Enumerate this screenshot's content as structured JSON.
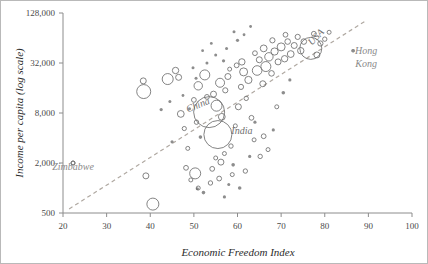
{
  "chart_data": {
    "type": "scatter",
    "title": "",
    "xlabel": "Economic Freedom Index",
    "ylabel": "Income per capita (log scale)",
    "xlim": [
      20,
      100
    ],
    "ylim": [
      500,
      128000
    ],
    "yscale": "log",
    "xticks": [
      20,
      30,
      40,
      50,
      60,
      70,
      80,
      90,
      100
    ],
    "xtick_labels": [
      "20",
      "30",
      "40",
      "50",
      "60",
      "70",
      "80",
      "90",
      "100"
    ],
    "yticks": [
      500,
      2000,
      8000,
      32000,
      128000
    ],
    "ytick_labels": [
      "500",
      "2,000",
      "8,000",
      "32,000",
      "128,000"
    ],
    "grid": false,
    "legend": "none",
    "marker_style": "open-circle-bubble",
    "size_encodes": "population",
    "trend_line": {
      "style": "dashed",
      "color": "#b0a9a2",
      "x_start": 21.4,
      "y_start": 560,
      "x_end": 89.5,
      "y_end": 104000
    },
    "annotations": [
      {
        "label": "Zimbabwe",
        "x": 22.3,
        "y": 1650,
        "marker_x": 22.3,
        "marker_y": 2000,
        "rotation": 0
      },
      {
        "label": "China",
        "x": 51.2,
        "y": 9200,
        "marker_x": 53.5,
        "marker_y": 8200,
        "rotation": -22
      },
      {
        "label": "India",
        "x": 61.0,
        "y": 4450,
        "marker_x": 55.5,
        "marker_y": 4400,
        "rotation": 0
      },
      {
        "label": "USA",
        "x": 78.5,
        "y": 62000,
        "marker_x": 76.8,
        "marker_y": 48000,
        "rotation": -45
      },
      {
        "label": "Hong Kong",
        "x": 89.5,
        "y": 41000,
        "marker_x": 86.5,
        "marker_y": 45000,
        "rotation": 0
      }
    ],
    "points": [
      {
        "x": 22.3,
        "y": 2000,
        "r": 2.0
      },
      {
        "x": 39.0,
        "y": 1400,
        "r": 3.0
      },
      {
        "x": 40.6,
        "y": 640,
        "r": 6.0
      },
      {
        "x": 38.5,
        "y": 14500,
        "r": 7.0
      },
      {
        "x": 38.4,
        "y": 19500,
        "r": 3.0
      },
      {
        "x": 44.0,
        "y": 20500,
        "r": 5.5
      },
      {
        "x": 42.5,
        "y": 8800,
        "r": 1.6
      },
      {
        "x": 45.0,
        "y": 3600,
        "r": 1.6
      },
      {
        "x": 45.8,
        "y": 26000,
        "r": 3.2
      },
      {
        "x": 46.5,
        "y": 21500,
        "r": 3.0
      },
      {
        "x": 47.0,
        "y": 7800,
        "r": 3.4
      },
      {
        "x": 47.8,
        "y": 5200,
        "r": 2.1
      },
      {
        "x": 48.6,
        "y": 3000,
        "r": 2.0
      },
      {
        "x": 48.2,
        "y": 1750,
        "r": 2.4
      },
      {
        "x": 49.3,
        "y": 1250,
        "r": 2.0
      },
      {
        "x": 50.3,
        "y": 1500,
        "r": 5.5
      },
      {
        "x": 50.8,
        "y": 980,
        "r": 1.6
      },
      {
        "x": 51.5,
        "y": 4100,
        "r": 1.8
      },
      {
        "x": 50.6,
        "y": 6200,
        "r": 2.2
      },
      {
        "x": 50.0,
        "y": 11500,
        "r": 2.4
      },
      {
        "x": 49.0,
        "y": 9000,
        "r": 1.5
      },
      {
        "x": 51.0,
        "y": 17000,
        "r": 4.2
      },
      {
        "x": 52.5,
        "y": 23000,
        "r": 5.0
      },
      {
        "x": 53.5,
        "y": 8200,
        "r": 15.5
      },
      {
        "x": 53.0,
        "y": 12500,
        "r": 2.4
      },
      {
        "x": 54.5,
        "y": 13500,
        "r": 3.0
      },
      {
        "x": 55.5,
        "y": 4400,
        "r": 14.0
      },
      {
        "x": 55.2,
        "y": 9800,
        "r": 5.5
      },
      {
        "x": 56.4,
        "y": 7200,
        "r": 3.4
      },
      {
        "x": 56.0,
        "y": 18500,
        "r": 4.5
      },
      {
        "x": 57.2,
        "y": 15000,
        "r": 2.6
      },
      {
        "x": 57.8,
        "y": 22000,
        "r": 3.0
      },
      {
        "x": 57.0,
        "y": 2600,
        "r": 2.0
      },
      {
        "x": 56.2,
        "y": 2050,
        "r": 3.0
      },
      {
        "x": 55.0,
        "y": 2300,
        "r": 2.0
      },
      {
        "x": 54.2,
        "y": 1700,
        "r": 2.4
      },
      {
        "x": 58.5,
        "y": 3200,
        "r": 2.2
      },
      {
        "x": 59.0,
        "y": 1900,
        "r": 1.8
      },
      {
        "x": 58.0,
        "y": 1100,
        "r": 1.5
      },
      {
        "x": 59.5,
        "y": 5600,
        "r": 2.0
      },
      {
        "x": 60.2,
        "y": 9500,
        "r": 3.0
      },
      {
        "x": 60.8,
        "y": 16500,
        "r": 2.6
      },
      {
        "x": 61.4,
        "y": 25000,
        "r": 4.0
      },
      {
        "x": 61.0,
        "y": 33000,
        "r": 3.2
      },
      {
        "x": 59.8,
        "y": 30000,
        "r": 2.4
      },
      {
        "x": 62.5,
        "y": 20000,
        "r": 3.6
      },
      {
        "x": 62.0,
        "y": 12000,
        "r": 2.2
      },
      {
        "x": 63.2,
        "y": 7000,
        "r": 2.4
      },
      {
        "x": 63.8,
        "y": 3800,
        "r": 2.0
      },
      {
        "x": 62.8,
        "y": 2400,
        "r": 1.6
      },
      {
        "x": 64.5,
        "y": 26000,
        "r": 4.8
      },
      {
        "x": 65.0,
        "y": 35000,
        "r": 3.0
      },
      {
        "x": 64.0,
        "y": 42000,
        "r": 2.4
      },
      {
        "x": 65.8,
        "y": 18000,
        "r": 3.0
      },
      {
        "x": 66.5,
        "y": 29000,
        "r": 5.0
      },
      {
        "x": 66.0,
        "y": 48000,
        "r": 3.4
      },
      {
        "x": 67.2,
        "y": 38000,
        "r": 4.2
      },
      {
        "x": 67.8,
        "y": 24000,
        "r": 2.8
      },
      {
        "x": 68.5,
        "y": 44000,
        "r": 3.6
      },
      {
        "x": 68.0,
        "y": 60000,
        "r": 2.6
      },
      {
        "x": 69.3,
        "y": 33000,
        "r": 3.0
      },
      {
        "x": 70.0,
        "y": 50000,
        "r": 4.0
      },
      {
        "x": 70.8,
        "y": 36000,
        "r": 3.2
      },
      {
        "x": 71.5,
        "y": 58000,
        "r": 2.8
      },
      {
        "x": 72.2,
        "y": 41000,
        "r": 3.4
      },
      {
        "x": 71.0,
        "y": 70000,
        "r": 2.4
      },
      {
        "x": 73.0,
        "y": 52000,
        "r": 3.0
      },
      {
        "x": 73.8,
        "y": 66000,
        "r": 2.6
      },
      {
        "x": 74.5,
        "y": 45000,
        "r": 3.2
      },
      {
        "x": 75.2,
        "y": 58000,
        "r": 2.8
      },
      {
        "x": 76.8,
        "y": 48000,
        "r": 11.0
      },
      {
        "x": 77.5,
        "y": 72000,
        "r": 2.4
      },
      {
        "x": 78.2,
        "y": 40000,
        "r": 3.0
      },
      {
        "x": 79.0,
        "y": 55000,
        "r": 2.6
      },
      {
        "x": 80.0,
        "y": 62000,
        "r": 2.2
      },
      {
        "x": 81.0,
        "y": 75000,
        "r": 2.0
      },
      {
        "x": 86.5,
        "y": 45000,
        "r": 1.8
      },
      {
        "x": 64.0,
        "y": 6200,
        "r": 1.6
      },
      {
        "x": 66.0,
        "y": 4200,
        "r": 2.4
      },
      {
        "x": 67.0,
        "y": 2900,
        "r": 2.0
      },
      {
        "x": 65.2,
        "y": 2400,
        "r": 2.2
      },
      {
        "x": 68.2,
        "y": 5000,
        "r": 1.6
      },
      {
        "x": 69.0,
        "y": 9500,
        "r": 2.0
      },
      {
        "x": 70.5,
        "y": 14000,
        "r": 1.8
      },
      {
        "x": 72.0,
        "y": 20000,
        "r": 1.6
      },
      {
        "x": 60.0,
        "y": 60000,
        "r": 1.6
      },
      {
        "x": 57.5,
        "y": 48000,
        "r": 1.5
      },
      {
        "x": 55.0,
        "y": 40000,
        "r": 1.5
      },
      {
        "x": 52.0,
        "y": 45000,
        "r": 1.4
      },
      {
        "x": 53.0,
        "y": 32000,
        "r": 1.5
      },
      {
        "x": 61.5,
        "y": 70000,
        "r": 1.4
      },
      {
        "x": 63.0,
        "y": 88000,
        "r": 1.4
      },
      {
        "x": 59.2,
        "y": 76000,
        "r": 1.5
      },
      {
        "x": 51.0,
        "y": 1000,
        "r": 2.0
      },
      {
        "x": 52.2,
        "y": 880,
        "r": 1.8
      },
      {
        "x": 53.8,
        "y": 1150,
        "r": 2.2
      },
      {
        "x": 55.8,
        "y": 1300,
        "r": 2.4
      },
      {
        "x": 57.0,
        "y": 780,
        "r": 1.6
      },
      {
        "x": 58.8,
        "y": 1450,
        "r": 2.0
      },
      {
        "x": 60.5,
        "y": 1000,
        "r": 1.8
      },
      {
        "x": 61.8,
        "y": 1600,
        "r": 2.2
      },
      {
        "x": 47.5,
        "y": 13000,
        "r": 1.4
      },
      {
        "x": 44.5,
        "y": 11000,
        "r": 1.5
      },
      {
        "x": 49.8,
        "y": 28000,
        "r": 1.5
      },
      {
        "x": 54.0,
        "y": 55000,
        "r": 1.4
      },
      {
        "x": 56.8,
        "y": 34000,
        "r": 1.6
      },
      {
        "x": 58.2,
        "y": 27000,
        "r": 2.0
      },
      {
        "x": 50.5,
        "y": 21000,
        "r": 1.5
      }
    ]
  },
  "axes": {
    "y_axis_title": "Income per capita (log scale)",
    "x_axis_title": "Economic Freedom Index"
  }
}
